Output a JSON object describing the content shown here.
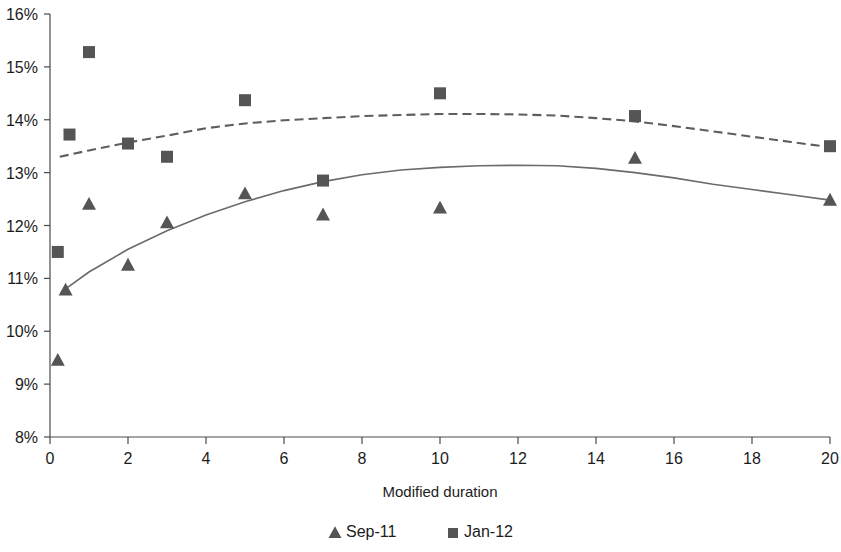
{
  "chart_data": {
    "type": "scatter",
    "title": "",
    "subtitle": "",
    "xlabel": "Modified duration",
    "ylabel": "",
    "xlim": [
      0,
      20
    ],
    "ylim": [
      8,
      16
    ],
    "x_ticks": [
      0,
      2,
      4,
      6,
      8,
      10,
      12,
      14,
      16,
      18,
      20
    ],
    "x_tick_labels": [
      "0",
      "2",
      "4",
      "6",
      "8",
      "10",
      "12",
      "14",
      "16",
      "18",
      "20"
    ],
    "y_ticks": [
      8,
      9,
      10,
      11,
      12,
      13,
      14,
      15,
      16
    ],
    "y_tick_labels": [
      "8%",
      "9%",
      "10%",
      "11%",
      "12%",
      "13%",
      "14%",
      "15%",
      "16%"
    ],
    "grid": false,
    "legend_position": "bottom",
    "value_unit": "%",
    "series": [
      {
        "name": "Sep-11",
        "marker": "triangle",
        "color": "#555555",
        "trendline": "solid",
        "points": [
          {
            "x": 0.2,
            "y": 9.45
          },
          {
            "x": 0.4,
            "y": 10.78
          },
          {
            "x": 1.0,
            "y": 12.4
          },
          {
            "x": 2.0,
            "y": 11.25
          },
          {
            "x": 3.0,
            "y": 12.05
          },
          {
            "x": 5.0,
            "y": 12.6
          },
          {
            "x": 7.0,
            "y": 12.2
          },
          {
            "x": 10.0,
            "y": 12.33
          },
          {
            "x": 15.0,
            "y": 13.27
          },
          {
            "x": 20.0,
            "y": 12.48
          }
        ],
        "trend_points": [
          {
            "x": 0.3,
            "y": 10.75
          },
          {
            "x": 1.0,
            "y": 11.12
          },
          {
            "x": 2.0,
            "y": 11.55
          },
          {
            "x": 3.0,
            "y": 11.9
          },
          {
            "x": 4.0,
            "y": 12.2
          },
          {
            "x": 5.0,
            "y": 12.45
          },
          {
            "x": 6.0,
            "y": 12.66
          },
          {
            "x": 7.0,
            "y": 12.83
          },
          {
            "x": 8.0,
            "y": 12.96
          },
          {
            "x": 9.0,
            "y": 13.05
          },
          {
            "x": 10.0,
            "y": 13.1
          },
          {
            "x": 11.0,
            "y": 13.13
          },
          {
            "x": 12.0,
            "y": 13.14
          },
          {
            "x": 13.0,
            "y": 13.13
          },
          {
            "x": 14.0,
            "y": 13.08
          },
          {
            "x": 15.0,
            "y": 13.0
          },
          {
            "x": 16.0,
            "y": 12.9
          },
          {
            "x": 17.0,
            "y": 12.78
          },
          {
            "x": 18.0,
            "y": 12.68
          },
          {
            "x": 19.0,
            "y": 12.58
          },
          {
            "x": 20.0,
            "y": 12.48
          }
        ]
      },
      {
        "name": "Jan-12",
        "marker": "square",
        "color": "#555555",
        "trendline": "dashed",
        "points": [
          {
            "x": 0.2,
            "y": 11.5
          },
          {
            "x": 0.5,
            "y": 13.72
          },
          {
            "x": 1.0,
            "y": 15.28
          },
          {
            "x": 2.0,
            "y": 13.55
          },
          {
            "x": 3.0,
            "y": 13.3
          },
          {
            "x": 5.0,
            "y": 14.37
          },
          {
            "x": 7.0,
            "y": 12.85
          },
          {
            "x": 10.0,
            "y": 14.5
          },
          {
            "x": 15.0,
            "y": 14.07
          },
          {
            "x": 20.0,
            "y": 13.5
          }
        ],
        "trend_points": [
          {
            "x": 0.25,
            "y": 13.3
          },
          {
            "x": 1.0,
            "y": 13.42
          },
          {
            "x": 2.0,
            "y": 13.57
          },
          {
            "x": 3.0,
            "y": 13.7
          },
          {
            "x": 4.0,
            "y": 13.84
          },
          {
            "x": 5.0,
            "y": 13.93
          },
          {
            "x": 6.0,
            "y": 13.99
          },
          {
            "x": 7.0,
            "y": 14.03
          },
          {
            "x": 8.0,
            "y": 14.07
          },
          {
            "x": 9.0,
            "y": 14.09
          },
          {
            "x": 10.0,
            "y": 14.11
          },
          {
            "x": 11.0,
            "y": 14.11
          },
          {
            "x": 12.0,
            "y": 14.1
          },
          {
            "x": 13.0,
            "y": 14.08
          },
          {
            "x": 14.0,
            "y": 14.03
          },
          {
            "x": 15.0,
            "y": 13.97
          },
          {
            "x": 16.0,
            "y": 13.88
          },
          {
            "x": 17.0,
            "y": 13.78
          },
          {
            "x": 18.0,
            "y": 13.68
          },
          {
            "x": 19.0,
            "y": 13.58
          },
          {
            "x": 20.0,
            "y": 13.48
          }
        ]
      }
    ]
  },
  "legend": {
    "items": [
      {
        "label": "Sep-11",
        "marker": "triangle"
      },
      {
        "label": "Jan-12",
        "marker": "square"
      }
    ]
  },
  "axes": {
    "x_title": "Modified duration"
  }
}
